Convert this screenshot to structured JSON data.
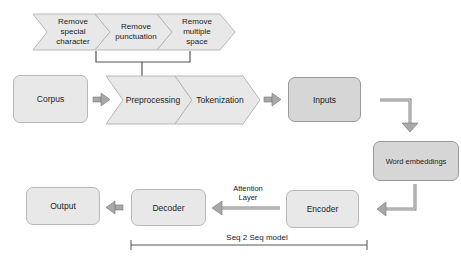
{
  "diagram": {
    "cleaning_steps": [
      {
        "label": "Remove special character"
      },
      {
        "label": "Remove punctuation"
      },
      {
        "label": "Remove multiple space"
      }
    ],
    "nodes": {
      "corpus": "Corpus",
      "preprocessing": "Preprocessing",
      "tokenization": "Tokenization",
      "inputs": "Inputs",
      "word_embeddings": "Word embeddings",
      "encoder": "Encoder",
      "decoder": "Decoder",
      "output": "Output"
    },
    "annotations": {
      "attention_layer": "Attention Layer",
      "seq2seq": "Seq 2 Seq model"
    },
    "colors": {
      "light_fill": "#e8e8e8",
      "mid_fill": "#d6d6d6",
      "arrow_fill": "#a8a8a8",
      "line": "#555555"
    }
  }
}
